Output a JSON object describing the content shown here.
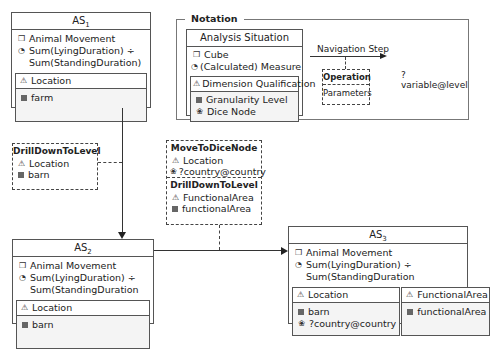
{
  "as1": {
    "title": "AS",
    "sub": "1",
    "cube": "Animal Movement",
    "measure_1": "Sum(LyingDuration) ÷",
    "measure_2": "Sum(StandingDuration)",
    "dims": [
      {
        "name": "Location",
        "levels": [
          {
            "type": "granularity",
            "label": "farm"
          }
        ]
      }
    ]
  },
  "as2": {
    "title": "AS",
    "sub": "2",
    "cube": "Animal Movement",
    "measure_1": "Sum(LyingDuration) ÷",
    "measure_2": "Sum(StandingDuration",
    "dims": [
      {
        "name": "Location",
        "levels": [
          {
            "type": "granularity",
            "label": "barn"
          }
        ]
      }
    ]
  },
  "as3": {
    "title": "AS",
    "sub": "3",
    "cube": "Animal Movement",
    "measure_1": "Sum(LyingDuration) ÷",
    "measure_2": "Sum(StandingDuration",
    "dims": [
      {
        "name": "Location",
        "levels": [
          {
            "type": "granularity",
            "label": "barn"
          },
          {
            "type": "dice",
            "label": "?country@country"
          }
        ]
      },
      {
        "name": "FunctionalArea",
        "levels": [
          {
            "type": "granularity",
            "label": "functionalArea"
          }
        ]
      }
    ]
  },
  "step1": {
    "operation": "DrillDownToLevel",
    "dim": "Location",
    "level": "barn"
  },
  "step2": {
    "op1": "MoveToDiceNode",
    "op1_dim": "Location",
    "op1_node": "?country@country",
    "op2": "DrillDownToLevel",
    "op2_dim": "FunctionalArea",
    "op2_level": "functionalArea"
  },
  "notation": {
    "title": "Notation",
    "as_title": "Analysis Situation",
    "cube": "Cube",
    "measure": "(Calculated) Measure",
    "dim": "Dimension Qualification",
    "granularity": "Granularity Level",
    "dice": "Dice Node",
    "nav_step": "Navigation Step",
    "operation": "Operation",
    "parameters": "Parameters",
    "variable": "?variable@level"
  }
}
